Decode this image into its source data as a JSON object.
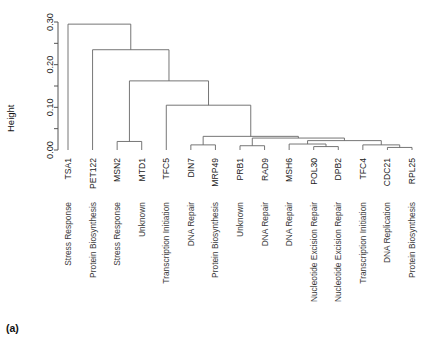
{
  "figure": {
    "caption": "(a)",
    "yaxis_title": "Height",
    "plot_type": "dendrogram"
  },
  "chart_data": {
    "type": "dendrogram",
    "title": "",
    "xlabel": "",
    "ylabel": "Height",
    "ylim": [
      0.0,
      0.3
    ],
    "grid": false,
    "legend": "none",
    "ytick_labels": [
      "0.00",
      "0.10",
      "0.20",
      "0.30"
    ],
    "ytick_values": [
      0.0,
      0.1,
      0.2,
      0.3
    ],
    "yminor_tick_values": [
      0.05,
      0.15,
      0.25
    ],
    "leaf_order": [
      "TSA1",
      "PET122",
      "MSN2",
      "MTD1",
      "TFC5",
      "DIN7",
      "MRP49",
      "PRB1",
      "RAD9",
      "MSH6",
      "POL30",
      "DPB2",
      "TFC4",
      "CDC21",
      "RPL25"
    ],
    "leaf_labels": [
      "TSA1",
      "PET122",
      "MSN2",
      "MTD1",
      "TFC5",
      "DIN7",
      "MRP49",
      "PRB1",
      "RAD9",
      "MSH6",
      "POL30",
      "DPB2",
      "TFC4",
      "CDC21",
      "RPL25"
    ],
    "leaf_functions": [
      "Stress Response",
      "Protein Biosynthesis",
      "Stress Response",
      "Unknown",
      "Transcription Initiation",
      "DNA Repair",
      "Protein Biosynthesis",
      "Unknown",
      "DNA Repair",
      "DNA Repair",
      "Nucleotide Excision Repair",
      "Nucleotide Excision Repair",
      "Transcription Initiation",
      "DNA Replication",
      "Protein Biosynthesis"
    ],
    "merges": [
      {
        "id": "m1",
        "height": 0.02,
        "left": "MSN2",
        "right": "MTD1"
      },
      {
        "id": "m2",
        "height": 0.012,
        "left": "DIN7",
        "right": "MRP49"
      },
      {
        "id": "m3",
        "height": 0.01,
        "left": "PRB1",
        "right": "RAD9"
      },
      {
        "id": "m4",
        "height": 0.008,
        "left": "POL30",
        "right": "DPB2"
      },
      {
        "id": "m5",
        "height": 0.006,
        "left": "CDC21",
        "right": "RPL25"
      },
      {
        "id": "m6",
        "height": 0.014,
        "left": "m4",
        "right": "MSH6"
      },
      {
        "id": "m7",
        "height": 0.012,
        "left": "TFC4",
        "right": "m5"
      },
      {
        "id": "m8",
        "height": 0.022,
        "left": "m6",
        "right": "m7"
      },
      {
        "id": "m9",
        "height": 0.028,
        "left": "m3",
        "right": "m8"
      },
      {
        "id": "m10",
        "height": 0.032,
        "left": "m2",
        "right": "m9"
      },
      {
        "id": "m11",
        "height": 0.105,
        "left": "TFC5",
        "right": "m10"
      },
      {
        "id": "m12",
        "height": 0.162,
        "left": "m1",
        "right": "m11"
      },
      {
        "id": "m13",
        "height": 0.235,
        "left": "PET122",
        "right": "m12"
      },
      {
        "id": "m14",
        "height": 0.295,
        "left": "TSA1",
        "right": "m13"
      }
    ]
  }
}
